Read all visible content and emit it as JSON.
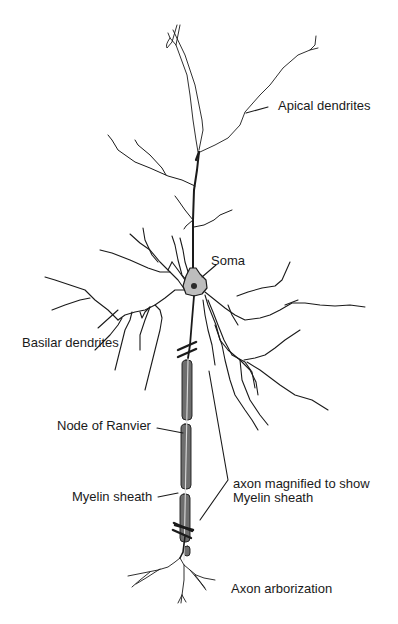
{
  "figure": {
    "labels": {
      "apical_dendrites": "Apical dendrites",
      "soma": "Soma",
      "basilar_dendrites": "Basilar dendrites",
      "node_of_ranvier": "Node of Ranvier",
      "myelin_sheath": "Myelin sheath",
      "axon_magnified_line1": "axon magnified to show",
      "axon_magnified_line2": "Myelin sheath",
      "axon_arborization": "Axon arborization"
    },
    "colors": {
      "ink": "#1a1a1a",
      "myelin_fill": "#6e6e6e",
      "soma_fill": "#bdbdbd",
      "background": "#ffffff"
    }
  }
}
